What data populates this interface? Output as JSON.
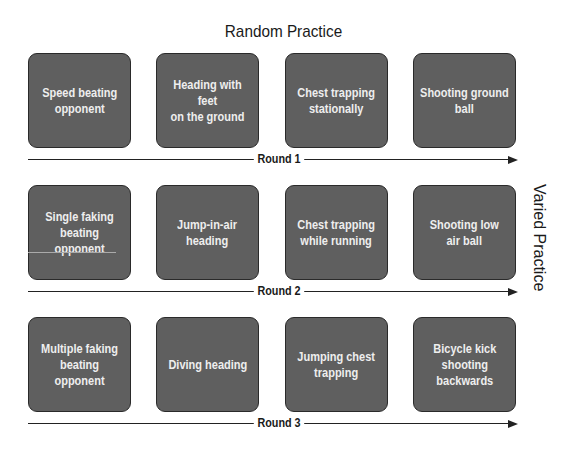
{
  "title": "Random Practice",
  "side_label": "Varied Practice",
  "rounds": [
    {
      "label": "Round 1",
      "items": [
        "Speed beating\nopponent",
        "Heading with feet\non the ground",
        "Chest trapping\nstationally",
        "Shooting ground\nball"
      ]
    },
    {
      "label": "Round 2",
      "items": [
        "Single faking\nbeating opponent",
        "Jump-in-air\nheading",
        "Chest trapping\nwhile running",
        "Shooting low\nair ball"
      ]
    },
    {
      "label": "Round 3",
      "items": [
        "Multiple faking\nbeating opponent",
        "Diving heading",
        "Jumping chest\ntrapping",
        "Bicycle kick\nshooting\nbackwards"
      ]
    }
  ],
  "colors": {
    "box_fill": "#5f5f5f",
    "box_border": "#2a2a2a",
    "box_text": "#eeeeee"
  }
}
